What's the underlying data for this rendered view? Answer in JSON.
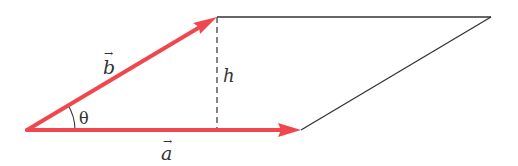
{
  "diagram": {
    "colors": {
      "vector": "#f0474e",
      "outline": "#333333",
      "height_line": "#333333",
      "text": "#333333",
      "background": "#ffffff"
    },
    "points": {
      "origin": [
        27,
        130
      ],
      "a_tip": [
        301,
        130
      ],
      "b_tip": [
        217,
        17
      ],
      "far_corner": [
        491,
        17
      ],
      "height_foot": [
        217,
        130
      ]
    },
    "labels": {
      "vector_a": "a",
      "vector_b": "b",
      "height": "h",
      "angle": "θ",
      "arrow_accent": "→"
    },
    "elements": [
      {
        "name": "vector-a",
        "type": "arrow",
        "from": "origin",
        "to": "a_tip",
        "label": "a"
      },
      {
        "name": "vector-b",
        "type": "arrow",
        "from": "origin",
        "to": "b_tip",
        "label": "b"
      },
      {
        "name": "top-edge",
        "type": "line",
        "from": "b_tip",
        "to": "far_corner"
      },
      {
        "name": "right-edge",
        "type": "line",
        "from": "a_tip",
        "to": "far_corner"
      },
      {
        "name": "height-line",
        "type": "dashed-line",
        "from": "b_tip",
        "to": "height_foot",
        "label": "h"
      },
      {
        "name": "angle-arc",
        "type": "arc",
        "center": "origin",
        "label": "θ"
      }
    ]
  }
}
